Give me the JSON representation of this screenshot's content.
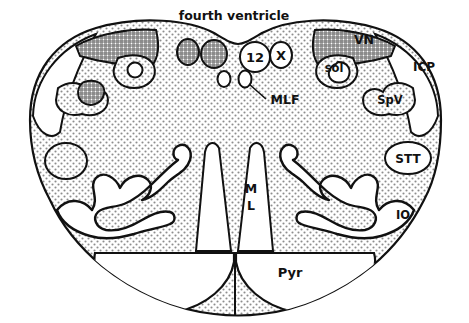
{
  "figure": {
    "kind": "anatomical-line-drawing",
    "background_color": "#ffffff",
    "ink_color": "#111111",
    "fill_stipple_color": "#9a9a9a",
    "fill_crosshatch_color": "#6f6f6f",
    "fill_white": "#ffffff"
  },
  "labels": {
    "fourth_ventricle": "fourth ventricle",
    "hypoglossal_nucleus": "12",
    "vagal_nucleus": "X",
    "solitary_nucleus": "sol",
    "vestibular_nucleus": "VN",
    "inferior_cerebellar_peduncle": "ICP",
    "spinal_trigeminal_nucleus": "SpV",
    "medial_longitudinal_fasciculus": "MLF",
    "spinothalamic_tract": "STT",
    "inferior_olive": "IO",
    "medial_lemniscus_line1": "M",
    "medial_lemniscus_line2": "L",
    "pyramid": "Pyr"
  }
}
